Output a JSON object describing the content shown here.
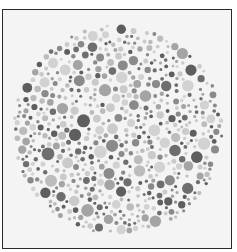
{
  "plate": {
    "type": "dot-pattern-test-plate",
    "center": [
      118,
      130
    ],
    "radius": 106,
    "background": "#f4f4f4",
    "border_color": "#2a2a2a",
    "dot_colors": [
      "#5e5e5e",
      "#6e6e6e",
      "#8a8a8a",
      "#a4a4a4",
      "#bcbcbc",
      "#cacaca",
      "#d2d2d2"
    ],
    "dot_radius_range": [
      1.5,
      6.5
    ],
    "seed": 7
  }
}
